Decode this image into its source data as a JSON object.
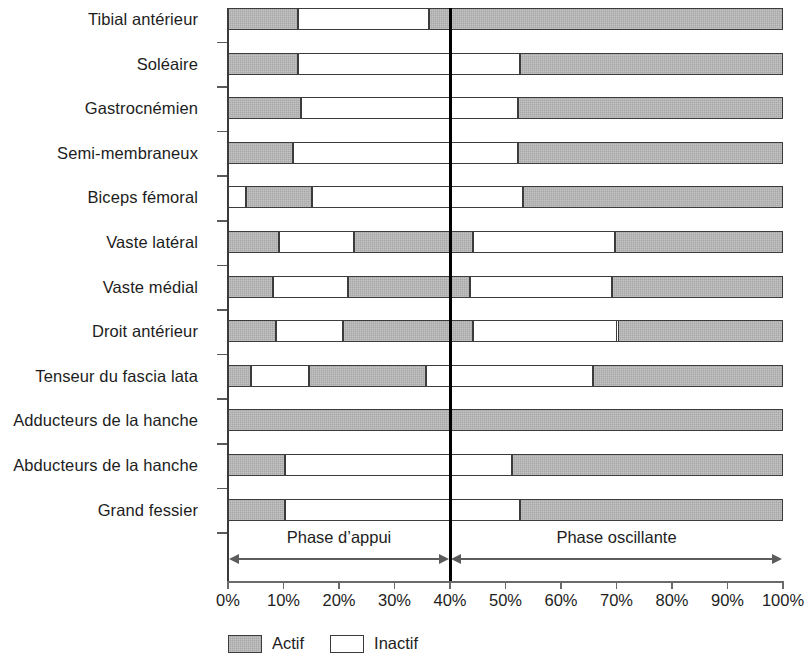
{
  "chart_data": {
    "type": "bar",
    "orientation": "horizontal",
    "subtype": "stacked-gantt-timeline",
    "title": "",
    "xlabel": "",
    "ylabel": "",
    "xlim": [
      0,
      100
    ],
    "xunit": "%",
    "grid": false,
    "legend_position": "bottom-left",
    "xtick_labels": [
      "0%",
      "10%",
      "20%",
      "30%",
      "40%",
      "50%",
      "60%",
      "70%",
      "80%",
      "90%",
      "100%"
    ],
    "xtick_values": [
      0,
      10,
      20,
      30,
      40,
      50,
      60,
      70,
      80,
      90,
      100
    ],
    "divider_value": 40,
    "phases": [
      {
        "name": "Phase d’appui",
        "start": 0,
        "end": 40
      },
      {
        "name": "Phase oscillante",
        "start": 40,
        "end": 100
      }
    ],
    "legend": [
      {
        "label": "Actif",
        "state": "active",
        "color": "#a8a8a8"
      },
      {
        "label": "Inactif",
        "state": "inactive",
        "color": "#ffffff"
      }
    ],
    "categories": [
      "Tibial antérieur",
      "Soléaire",
      "Gastrocnémien",
      "Semi-membraneux",
      "Biceps fémoral",
      "Vaste latéral",
      "Vaste médial",
      "Droit antérieur",
      "Tenseur du fascia lata",
      "Adducteurs de la hanche",
      "Abducteurs de la hanche",
      "Grand fessier"
    ],
    "rows": [
      {
        "category": "Tibial antérieur",
        "segments": [
          {
            "start": 0,
            "end": 12.5,
            "state": "active"
          },
          {
            "start": 12.5,
            "end": 36,
            "state": "inactive"
          },
          {
            "start": 36,
            "end": 100,
            "state": "active"
          }
        ]
      },
      {
        "category": "Soléaire",
        "segments": [
          {
            "start": 0,
            "end": 12.5,
            "state": "active"
          },
          {
            "start": 12.5,
            "end": 52.5,
            "state": "inactive"
          },
          {
            "start": 52.5,
            "end": 100,
            "state": "active"
          }
        ]
      },
      {
        "category": "Gastrocnémien",
        "segments": [
          {
            "start": 0,
            "end": 13,
            "state": "active"
          },
          {
            "start": 13,
            "end": 52,
            "state": "inactive"
          },
          {
            "start": 52,
            "end": 100,
            "state": "active"
          }
        ]
      },
      {
        "category": "Semi-membraneux",
        "segments": [
          {
            "start": 0,
            "end": 11.5,
            "state": "active"
          },
          {
            "start": 11.5,
            "end": 52,
            "state": "inactive"
          },
          {
            "start": 52,
            "end": 100,
            "state": "active"
          }
        ]
      },
      {
        "category": "Biceps fémoral",
        "segments": [
          {
            "start": 0,
            "end": 3,
            "state": "inactive"
          },
          {
            "start": 3,
            "end": 15,
            "state": "active"
          },
          {
            "start": 15,
            "end": 53,
            "state": "inactive"
          },
          {
            "start": 53,
            "end": 100,
            "state": "active"
          }
        ]
      },
      {
        "category": "Vaste latéral",
        "segments": [
          {
            "start": 0,
            "end": 9,
            "state": "active"
          },
          {
            "start": 9,
            "end": 22.5,
            "state": "inactive"
          },
          {
            "start": 22.5,
            "end": 44,
            "state": "active"
          },
          {
            "start": 44,
            "end": 69.5,
            "state": "inactive"
          },
          {
            "start": 69.5,
            "end": 100,
            "state": "active"
          }
        ]
      },
      {
        "category": "Vaste médial",
        "segments": [
          {
            "start": 0,
            "end": 8,
            "state": "active"
          },
          {
            "start": 8,
            "end": 21.5,
            "state": "inactive"
          },
          {
            "start": 21.5,
            "end": 43.5,
            "state": "active"
          },
          {
            "start": 43.5,
            "end": 69,
            "state": "inactive"
          },
          {
            "start": 69,
            "end": 100,
            "state": "active"
          }
        ]
      },
      {
        "category": "Droit antérieur",
        "segments": [
          {
            "start": 0,
            "end": 8.5,
            "state": "active"
          },
          {
            "start": 8.5,
            "end": 20.5,
            "state": "inactive"
          },
          {
            "start": 20.5,
            "end": 44,
            "state": "active"
          },
          {
            "start": 44,
            "end": 70,
            "state": "inactive"
          },
          {
            "start": 70,
            "end": 100,
            "state": "active"
          }
        ]
      },
      {
        "category": "Tenseur du fascia lata",
        "segments": [
          {
            "start": 0,
            "end": 4,
            "state": "active"
          },
          {
            "start": 4,
            "end": 14.5,
            "state": "inactive"
          },
          {
            "start": 14.5,
            "end": 35.5,
            "state": "active"
          },
          {
            "start": 35.5,
            "end": 65.5,
            "state": "inactive"
          },
          {
            "start": 65.5,
            "end": 100,
            "state": "active"
          }
        ]
      },
      {
        "category": "Adducteurs de la hanche",
        "segments": [
          {
            "start": 0,
            "end": 100,
            "state": "active"
          }
        ]
      },
      {
        "category": "Abducteurs de la hanche",
        "segments": [
          {
            "start": 0,
            "end": 10,
            "state": "active"
          },
          {
            "start": 10,
            "end": 51,
            "state": "inactive"
          },
          {
            "start": 51,
            "end": 100,
            "state": "active"
          }
        ]
      },
      {
        "category": "Grand fessier",
        "segments": [
          {
            "start": 0,
            "end": 10,
            "state": "active"
          },
          {
            "start": 10,
            "end": 52.5,
            "state": "inactive"
          },
          {
            "start": 52.5,
            "end": 100,
            "state": "active"
          }
        ]
      }
    ]
  }
}
